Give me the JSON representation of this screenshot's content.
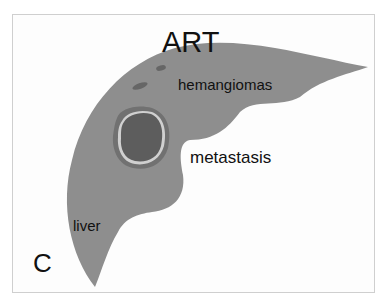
{
  "figure": {
    "panel_letter": "C",
    "title": "ART",
    "labels": {
      "hemangiomas": "hemangiomas",
      "metastasis": "metastasis",
      "liver": "liver"
    },
    "colors": {
      "background": "#fdfdfd",
      "border": "#cfcfcf",
      "liver": "#8e8e8e",
      "hemangioma": "#666666",
      "metastasis_rim": "#717171",
      "metastasis_halo": "#d0d0d0",
      "metastasis_core": "#5d5d5d",
      "text": "#111111"
    }
  }
}
